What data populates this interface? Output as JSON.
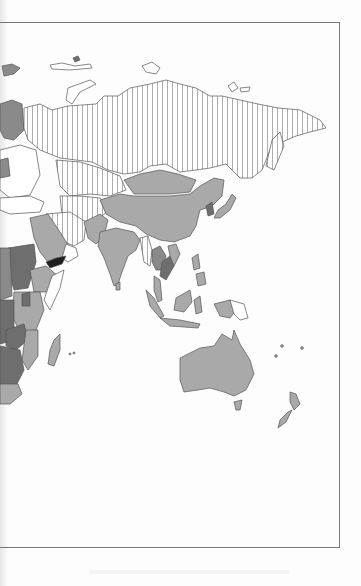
{
  "page": {
    "type": "scanned-book-page",
    "figure": "choropleth-world-map",
    "visible_region": "Asia, Middle East, East Africa, Oceania"
  },
  "map": {
    "shading_classes": [
      {
        "name": "hatched",
        "pattern": "vertical-lines",
        "color": "#ffffff",
        "regions": [
          "Russia",
          "Kazakhstan",
          "Central Asia",
          "Iran",
          "Oman/Gulf",
          "Myanmar (partial)",
          "Somalia"
        ]
      },
      {
        "name": "light-gray",
        "color": "#a9a9a9",
        "regions": [
          "China",
          "Mongolia",
          "India",
          "Saudi Arabia",
          "Japan",
          "Australia",
          "New Zealand",
          "Indonesia",
          "Malaysia",
          "Ethiopia",
          "Madagascar",
          "Philippines"
        ]
      },
      {
        "name": "medium-gray",
        "color": "#8a8a8a",
        "regions": [
          "Sudan",
          "Thailand",
          "Zambia",
          "Finland",
          "Scandinavia"
        ]
      },
      {
        "name": "dark-gray",
        "color": "#6e6e6e",
        "regions": [
          "Central Africa",
          "Southern Africa",
          "Cambodia",
          "Korea"
        ]
      },
      {
        "name": "black",
        "color": "#1e1e1e",
        "regions": [
          "Yemen"
        ]
      },
      {
        "name": "white",
        "color": "#ffffff",
        "regions": [
          "Papua New Guinea (east)",
          "Turkey",
          "Eastern Europe"
        ]
      }
    ],
    "border_color": "#555555",
    "frame_color": "#777777"
  }
}
